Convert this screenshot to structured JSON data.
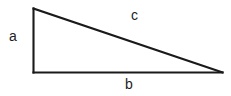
{
  "figure": {
    "type": "right-triangle-diagram",
    "background_color": "#ffffff",
    "stroke_color": "#1a1a1a",
    "label_color": "#1d1d1d",
    "stroke_width": 2,
    "vertices": {
      "top_left": {
        "x": 33,
        "y": 8
      },
      "bottom_left": {
        "x": 33,
        "y": 72
      },
      "bottom_right": {
        "x": 222,
        "y": 72
      }
    },
    "edges": [
      {
        "name": "vertical-leg",
        "label": "a",
        "from": "top_left",
        "to": "bottom_left"
      },
      {
        "name": "horizontal-leg",
        "label": "b",
        "from": "bottom_left",
        "to": "bottom_right"
      },
      {
        "name": "hypotenuse",
        "label": "c",
        "from": "top_left",
        "to": "bottom_right"
      }
    ],
    "labels": {
      "a": "a",
      "b": "b",
      "c": "c"
    }
  }
}
